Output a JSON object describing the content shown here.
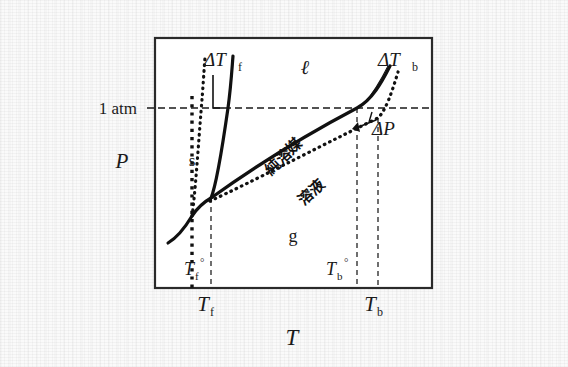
{
  "figure": {
    "kind": "phase-diagram",
    "caption_text": "",
    "axes": {
      "x_label": "T",
      "y_label": "P",
      "frame": {
        "x": 155,
        "y": 38,
        "width": 277,
        "height": 250
      }
    },
    "pressure_line": {
      "label": "1 atm",
      "y": 108,
      "style": "dashed"
    },
    "regions": [
      {
        "name": "solid",
        "label": "s",
        "x": 192,
        "y": 160
      },
      {
        "name": "liquid",
        "label": "ℓ",
        "x": 305,
        "y": 70
      },
      {
        "name": "gas",
        "label": "g",
        "x": 293,
        "y": 236
      }
    ],
    "curve_labels": [
      {
        "name": "pure-solvent",
        "label": "純溶媒",
        "x": 287,
        "y": 160,
        "rotation": -44
      },
      {
        "name": "solution",
        "label": "溶液",
        "x": 312,
        "y": 192,
        "rotation": -44
      }
    ],
    "annotations": [
      {
        "name": "delta-tf",
        "label": "ΔT",
        "sub": "f",
        "x": 212,
        "y": 60
      },
      {
        "name": "delta-tb",
        "label": "ΔT",
        "sub": "b",
        "x": 390,
        "y": 62
      },
      {
        "name": "delta-p",
        "label": "ΔP",
        "sub": "",
        "x": 383,
        "y": 128
      }
    ],
    "tick_labels": [
      {
        "name": "tf-zero",
        "base": "T",
        "sub": "f",
        "sup": "°",
        "x": 205,
        "y": 272,
        "inside": true
      },
      {
        "name": "tb-zero",
        "base": "T",
        "sub": "b",
        "sup": "°",
        "x": 345,
        "y": 272,
        "inside": true
      },
      {
        "name": "tf",
        "base": "T",
        "sub": "f",
        "sup": "",
        "x": 212,
        "y": 307,
        "inside": false
      },
      {
        "name": "tb",
        "base": "T",
        "sub": "b",
        "sup": "",
        "x": 378,
        "y": 307,
        "inside": false
      }
    ],
    "guide_lines": [
      {
        "name": "guide-tf-zero",
        "x": 192,
        "style": "dotted-thick"
      },
      {
        "name": "guide-tf",
        "x": 211,
        "style": "dashed-thin"
      },
      {
        "name": "guide-tb-zero",
        "x": 357,
        "style": "dashed-thin"
      },
      {
        "name": "guide-tb",
        "x": 378,
        "style": "dashed-thin"
      }
    ],
    "curves": [
      {
        "name": "sublimation-curve",
        "phase": "solid-gas",
        "style": "solid"
      },
      {
        "name": "fusion-curve-pure",
        "phase": "solid-liquid",
        "style": "solid"
      },
      {
        "name": "fusion-curve-solution",
        "phase": "solid-liquid",
        "style": "dotted"
      },
      {
        "name": "vaporization-curve-pure",
        "phase": "liquid-gas",
        "style": "solid"
      },
      {
        "name": "vaporization-curve-solution",
        "phase": "liquid-gas",
        "style": "dotted"
      }
    ],
    "colors": {
      "ink": "#111111",
      "frame": "#2a2a2a",
      "paper": "#fafafa",
      "guide": "#1a1a1a"
    }
  }
}
